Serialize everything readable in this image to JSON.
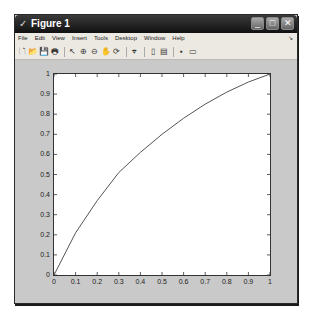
{
  "window": {
    "title": "Figure 1",
    "controls": {
      "minimize": "_",
      "maximize": "□",
      "close": "✕"
    }
  },
  "menubar": {
    "items": [
      "File",
      "Edit",
      "View",
      "Insert",
      "Tools",
      "Desktop",
      "Window",
      "Help"
    ]
  },
  "toolbar": {
    "buttons": [
      {
        "name": "new-figure-icon",
        "glyph": "🗋"
      },
      {
        "name": "open-file-icon",
        "glyph": "📂"
      },
      {
        "name": "save-icon",
        "glyph": "💾"
      },
      {
        "name": "print-icon",
        "glyph": "🖶"
      },
      {
        "name": "edit-plot-arrow-icon",
        "glyph": "↖"
      },
      {
        "name": "zoom-in-icon",
        "glyph": "⊕"
      },
      {
        "name": "zoom-out-icon",
        "glyph": "⊖"
      },
      {
        "name": "pan-hand-icon",
        "glyph": "✋"
      },
      {
        "name": "rotate-3d-icon",
        "glyph": "⟳"
      },
      {
        "name": "data-cursor-icon",
        "glyph": "⌖"
      },
      {
        "name": "insert-colorbar-icon",
        "glyph": "▯"
      },
      {
        "name": "insert-legend-icon",
        "glyph": "▤"
      },
      {
        "name": "hide-plot-tools-icon",
        "glyph": "▪"
      },
      {
        "name": "show-plot-tools-icon",
        "glyph": "▭"
      }
    ]
  },
  "chart_data": {
    "type": "line",
    "title": "",
    "xlabel": "",
    "ylabel": "",
    "xlim": [
      0,
      1
    ],
    "ylim": [
      0,
      1
    ],
    "grid": false,
    "legend": null,
    "x_ticks": [
      "0",
      "0.1",
      "0.2",
      "0.3",
      "0.4",
      "0.5",
      "0.6",
      "0.7",
      "0.8",
      "0.9",
      "1"
    ],
    "y_ticks": [
      "0",
      "0.1",
      "0.2",
      "0.3",
      "0.4",
      "0.5",
      "0.6",
      "0.7",
      "0.8",
      "0.9",
      "1"
    ],
    "series": [
      {
        "name": "curve",
        "color": "#555555",
        "x": [
          0,
          0.1,
          0.2,
          0.3,
          0.4,
          0.5,
          0.6,
          0.7,
          0.8,
          0.9,
          1.0
        ],
        "y": [
          0,
          0.21,
          0.37,
          0.51,
          0.61,
          0.7,
          0.78,
          0.85,
          0.91,
          0.96,
          1.0
        ]
      }
    ]
  }
}
